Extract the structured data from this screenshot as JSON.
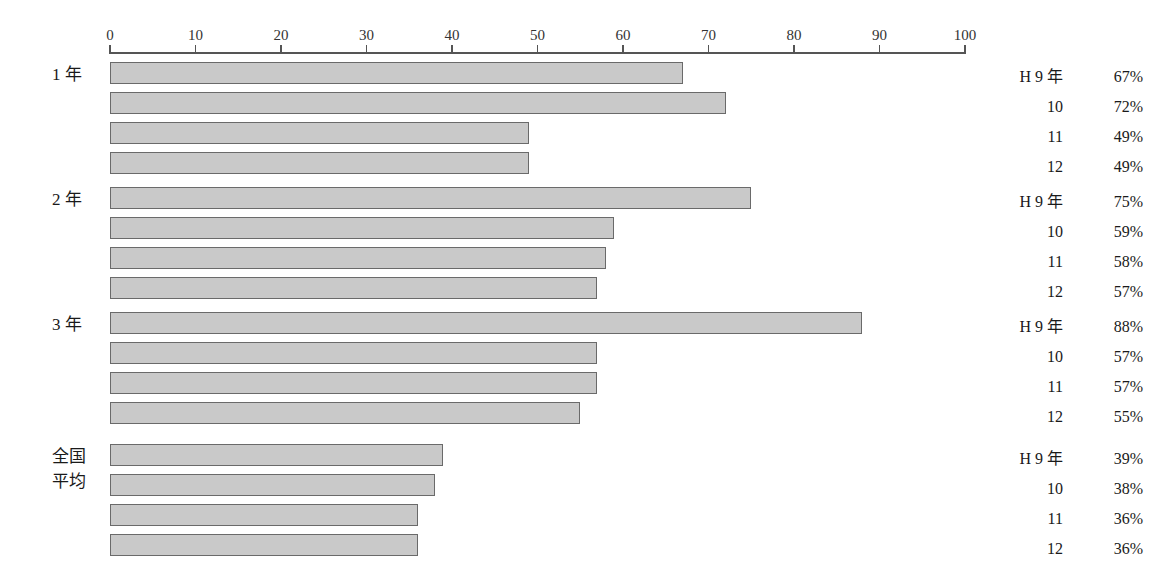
{
  "chart_data": {
    "type": "bar",
    "orientation": "horizontal",
    "title": "",
    "subtitle": "",
    "xlabel": "",
    "ylabel": "",
    "xlim": [
      0,
      100
    ],
    "grid": false,
    "legend_position": "right",
    "axis": {
      "ticks": [
        0,
        10,
        20,
        30,
        40,
        50,
        60,
        70,
        80,
        90,
        100
      ],
      "tick_labels": [
        "0",
        "10",
        "20",
        "30",
        "40",
        "50",
        "60",
        "70",
        "80",
        "90",
        "100"
      ]
    },
    "series": [
      {
        "name": "H 9 年",
        "values": [
          67,
          75,
          88,
          39
        ]
      },
      {
        "name": "10",
        "values": [
          72,
          59,
          57,
          38
        ]
      },
      {
        "name": "11",
        "values": [
          49,
          58,
          57,
          36
        ]
      },
      {
        "name": "12",
        "values": [
          49,
          57,
          55,
          36
        ]
      }
    ],
    "categories": [
      "1 年",
      "2 年",
      "3 年",
      "全国平均"
    ],
    "value_unit": "%",
    "colors": {
      "bar_fill": "#c9c9c9",
      "bar_border": "#6a6a6a",
      "axis": "#555555",
      "text": "#1a1a1a",
      "background": "#ffffff"
    }
  },
  "groups": [
    {
      "label_lines": [
        "1 年"
      ],
      "label": "1 年",
      "rows": [
        {
          "year": "H 9 年",
          "value": 67,
          "value_label": "67%"
        },
        {
          "year": "10",
          "value": 72,
          "value_label": "72%"
        },
        {
          "year": "11",
          "value": 49,
          "value_label": "49%"
        },
        {
          "year": "12",
          "value": 49,
          "value_label": "49%"
        }
      ]
    },
    {
      "label_lines": [
        "2 年"
      ],
      "label": "2 年",
      "rows": [
        {
          "year": "H 9 年",
          "value": 75,
          "value_label": "75%"
        },
        {
          "year": "10",
          "value": 59,
          "value_label": "59%"
        },
        {
          "year": "11",
          "value": 58,
          "value_label": "58%"
        },
        {
          "year": "12",
          "value": 57,
          "value_label": "57%"
        }
      ]
    },
    {
      "label_lines": [
        "3 年"
      ],
      "label": "3 年",
      "rows": [
        {
          "year": "H 9 年",
          "value": 88,
          "value_label": "88%"
        },
        {
          "year": "10",
          "value": 57,
          "value_label": "57%"
        },
        {
          "year": "11",
          "value": 57,
          "value_label": "57%"
        },
        {
          "year": "12",
          "value": 55,
          "value_label": "55%"
        }
      ]
    },
    {
      "label_lines": [
        "全国",
        "平均"
      ],
      "label": "全国平均",
      "rows": [
        {
          "year": "H 9 年",
          "value": 39,
          "value_label": "39%"
        },
        {
          "year": "10",
          "value": 38,
          "value_label": "38%"
        },
        {
          "year": "11",
          "value": 36,
          "value_label": "36%"
        },
        {
          "year": "12",
          "value": 36,
          "value_label": "36%"
        }
      ]
    }
  ],
  "layout": {
    "axis_left_px": 110,
    "axis_width_px": 855,
    "axis_top_px": 52,
    "group_tops_px": [
      62,
      187,
      312,
      444
    ],
    "row_height_px": 30,
    "bar_height_px": 22
  }
}
